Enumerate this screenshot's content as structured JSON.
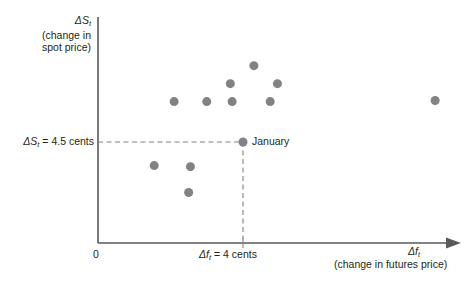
{
  "chart_data": {
    "type": "scatter",
    "title": "",
    "xlabel": "Δf_t (change in futures price)",
    "ylabel": "ΔS_t (change in spot price)",
    "xlim": [
      0,
      11.2
    ],
    "ylim": [
      0,
      10.6
    ],
    "grid": false,
    "legend": null,
    "x_axis": {
      "label_symbol": "Δf",
      "label_subscript": "t",
      "label_caption": "(change in futures price)",
      "origin_label": "0",
      "reference_tick_label": "Δf",
      "reference_tick_subscript": "t",
      "reference_tick_value": "= 4 cents",
      "reference_tick_x": 4
    },
    "y_axis": {
      "label_symbol": "ΔS",
      "label_subscript": "t",
      "label_caption_line1": "(change in",
      "label_caption_line2": "spot price)",
      "reference_line_label": "ΔS",
      "reference_line_subscript": "t",
      "reference_line_value": "= 4.5 cents",
      "reference_line_y": 4.5
    },
    "reference_lines": {
      "horizontal_dashed_y": 4.5,
      "vertical_dashed_x": 4
    },
    "annotations": [
      {
        "text": "January",
        "x": 4,
        "y": 4.5
      }
    ],
    "marker_color": "#808285",
    "marker_size": 9,
    "points": [
      {
        "x": 4.3,
        "y": 7.9,
        "label": ""
      },
      {
        "x": 3.65,
        "y": 7.1,
        "label": ""
      },
      {
        "x": 4.95,
        "y": 7.1,
        "label": ""
      },
      {
        "x": 2.1,
        "y": 6.3,
        "label": ""
      },
      {
        "x": 3.0,
        "y": 6.3,
        "label": ""
      },
      {
        "x": 3.7,
        "y": 6.3,
        "label": ""
      },
      {
        "x": 4.75,
        "y": 6.3,
        "label": ""
      },
      {
        "x": 4.0,
        "y": 4.5,
        "label": "January"
      },
      {
        "x": 1.55,
        "y": 3.45,
        "label": ""
      },
      {
        "x": 2.55,
        "y": 3.4,
        "label": ""
      },
      {
        "x": 2.5,
        "y": 2.25,
        "label": ""
      },
      {
        "x": 9.3,
        "y": 6.35,
        "label": ""
      }
    ]
  },
  "labels": {
    "y_title_symbol": "ΔS",
    "y_title_sub": "t",
    "y_title_line1": "(change in",
    "y_title_line2": "spot price)",
    "y_threshold_symbol": "ΔS",
    "y_threshold_sub": "t",
    "y_threshold_rest": "= 4.5 cents",
    "origin": "0",
    "x_threshold_symbol": "Δf",
    "x_threshold_sub": "t",
    "x_threshold_rest": "= 4 cents",
    "x_title_symbol": "Δf",
    "x_title_sub": "t",
    "x_subtitle": "(change in futures price)",
    "january": "January"
  },
  "colors": {
    "axis": "#58595b",
    "marker": "#808285",
    "dashed": "#808285",
    "text": "#231f20",
    "background": "#ffffff"
  }
}
